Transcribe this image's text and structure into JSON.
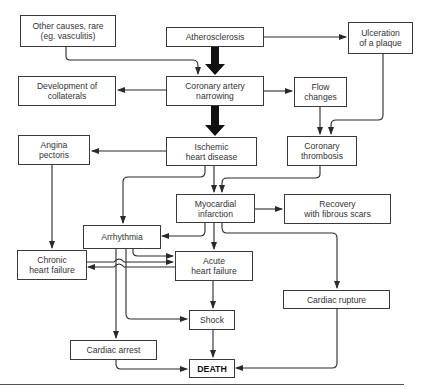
{
  "diagram": {
    "nodes": {
      "other_causes": {
        "label": "Other causes, rare\n(eg. vasculitis)"
      },
      "atherosclerosis": {
        "label": "Atherosclerosis"
      },
      "ulceration": {
        "label": "Ulceration\nof a plaque"
      },
      "collaterals": {
        "label": "Development of\ncollaterals"
      },
      "narrowing": {
        "label": "Coronary artery\nnarrowing"
      },
      "flow_changes": {
        "label": "Flow\nchanges"
      },
      "angina": {
        "label": "Angina\npectoris"
      },
      "ischemic": {
        "label": "Ischemic\nheart disease"
      },
      "thrombosis": {
        "label": "Coronary\nthrombosis"
      },
      "infarction": {
        "label": "Myocardial\ninfarction"
      },
      "recovery": {
        "label": "Recovery\nwith fibrous scars"
      },
      "arrhythmia": {
        "label": "Arrhythmia"
      },
      "chronic_hf": {
        "label": "Chronic\nheart failure"
      },
      "acute_hf": {
        "label": "Acute\nheart failure"
      },
      "rupture": {
        "label": "Cardiac rupture"
      },
      "shock": {
        "label": "Shock"
      },
      "arrest": {
        "label": "Cardiac arrest"
      },
      "death": {
        "label": "DEATH"
      }
    },
    "edges": [
      {
        "from": "other_causes",
        "to": "narrowing"
      },
      {
        "from": "atherosclerosis",
        "to": "narrowing",
        "style": "thick"
      },
      {
        "from": "atherosclerosis",
        "to": "ulceration"
      },
      {
        "from": "narrowing",
        "to": "collaterals"
      },
      {
        "from": "narrowing",
        "to": "flow_changes"
      },
      {
        "from": "narrowing",
        "to": "ischemic",
        "style": "thick"
      },
      {
        "from": "flow_changes",
        "to": "thrombosis"
      },
      {
        "from": "ulceration",
        "to": "thrombosis"
      },
      {
        "from": "ischemic",
        "to": "angina"
      },
      {
        "from": "ischemic",
        "to": "arrhythmia"
      },
      {
        "from": "ischemic",
        "to": "infarction"
      },
      {
        "from": "thrombosis",
        "to": "infarction"
      },
      {
        "from": "angina",
        "to": "chronic_hf"
      },
      {
        "from": "infarction",
        "to": "recovery"
      },
      {
        "from": "infarction",
        "to": "arrhythmia"
      },
      {
        "from": "infarction",
        "to": "acute_hf"
      },
      {
        "from": "infarction",
        "to": "rupture"
      },
      {
        "from": "arrhythmia",
        "to": "acute_hf"
      },
      {
        "from": "chronic_hf",
        "to": "acute_hf"
      },
      {
        "from": "acute_hf",
        "to": "chronic_hf"
      },
      {
        "from": "arrhythmia",
        "to": "shock"
      },
      {
        "from": "arrhythmia",
        "to": "arrest"
      },
      {
        "from": "acute_hf",
        "to": "shock"
      },
      {
        "from": "shock",
        "to": "death"
      },
      {
        "from": "arrest",
        "to": "death"
      },
      {
        "from": "rupture",
        "to": "death"
      }
    ],
    "colors": {
      "line": "#2a2a2a",
      "box_border": "#3a3a3a",
      "background": "#ffffff"
    }
  }
}
